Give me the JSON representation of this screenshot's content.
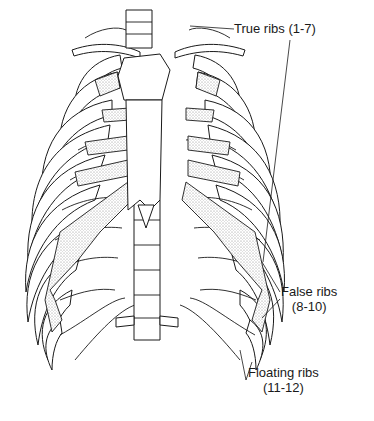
{
  "figure": {
    "labels": {
      "true_ribs": {
        "line1": "True ribs (1-7)",
        "line2": ""
      },
      "false_ribs": {
        "line1": "False ribs",
        "line2": "(8-10)"
      },
      "floating_ribs": {
        "line1": "Floating ribs",
        "line2": "(11-12)"
      }
    },
    "colors": {
      "ink": "#1a1a1a",
      "background": "#ffffff",
      "cartilage_stipple": "#9a9a9a"
    }
  }
}
